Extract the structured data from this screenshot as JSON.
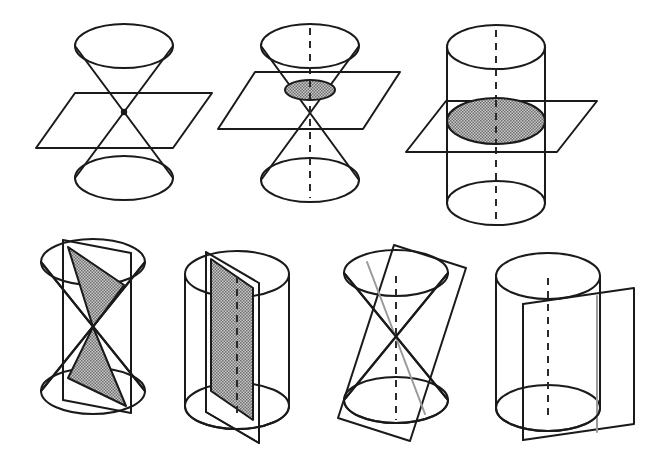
{
  "figure": {
    "title": "Conic sections and cylindrical sections",
    "background_color": "#ffffff",
    "line_color": "#1a1a1a",
    "hidden_line_color": "#2a2a2a",
    "shading_color": "#999999",
    "tangent_line_color": "#9a9a9a",
    "width": 646,
    "height": 469,
    "rows": 2,
    "panel_count": 7
  },
  "panels": [
    {
      "id": "panel-1",
      "row": 1,
      "column": 1,
      "solid": "double-cone",
      "plane": "horizontal-through-apex",
      "section": "point",
      "shaded": false,
      "axis_shown": false,
      "caption": "Plane through the apex of a double cone: the section is a single point"
    },
    {
      "id": "panel-2",
      "row": 1,
      "column": 2,
      "solid": "double-cone",
      "plane": "horizontal-above-apex",
      "section": "circle",
      "shaded": true,
      "axis_shown": true,
      "caption": "Horizontal plane cutting one nappe of a double cone: the section is a circle"
    },
    {
      "id": "panel-3",
      "row": 1,
      "column": 3,
      "solid": "cylinder",
      "plane": "horizontal",
      "section": "circle",
      "shaded": true,
      "axis_shown": true,
      "caption": "Horizontal plane cutting a cylinder: the section is a circle"
    },
    {
      "id": "panel-4",
      "row": 2,
      "column": 1,
      "solid": "double-cone",
      "plane": "vertical-through-axis",
      "section": "two-triangles",
      "shaded": true,
      "axis_shown": false,
      "caption": "Vertical plane through the axis of a double cone: the section is two triangles"
    },
    {
      "id": "panel-5",
      "row": 2,
      "column": 2,
      "solid": "cylinder",
      "plane": "vertical-through-axis",
      "section": "rectangle",
      "shaded": true,
      "axis_shown": true,
      "caption": "Vertical plane through the axis of a cylinder: the section is a rectangle"
    },
    {
      "id": "panel-6",
      "row": 2,
      "column": 3,
      "solid": "double-cone",
      "plane": "tangent-oblique",
      "section": "line",
      "shaded": false,
      "axis_shown": true,
      "caption": "Oblique tangent plane touching a double cone: the section is a single line"
    },
    {
      "id": "panel-7",
      "row": 2,
      "column": 4,
      "solid": "cylinder",
      "plane": "tangent-vertical",
      "section": "line",
      "shaded": false,
      "axis_shown": true,
      "caption": "Vertical tangent plane touching a cylinder: the section is a single line"
    }
  ],
  "geometry": {
    "panel_1": {
      "top_ellipse": {
        "cx": 124,
        "cy": 46,
        "rx": 49,
        "ry": 22
      },
      "bottom_ellipse": {
        "cx": 124,
        "cy": 178,
        "rx": 49,
        "ry": 22
      },
      "apex": {
        "x": 124,
        "y": 112
      },
      "plane_points": "75,93 212,93 173,148 36,148"
    },
    "panel_2": {
      "top_ellipse": {
        "cx": 310,
        "cy": 46,
        "rx": 49,
        "ry": 22
      },
      "bottom_ellipse": {
        "cx": 310,
        "cy": 180,
        "rx": 49,
        "ry": 22
      },
      "apex": {
        "x": 310,
        "y": 114
      },
      "section_ellipse": {
        "cx": 310,
        "cy": 90,
        "rx": 25,
        "ry": 10
      },
      "plane_points": "255,72 400,72 363,129 218,129"
    },
    "panel_3": {
      "top_ellipse": {
        "cx": 496,
        "cy": 47,
        "rx": 49,
        "ry": 22
      },
      "bottom_ellipse": {
        "cx": 496,
        "cy": 203,
        "rx": 49,
        "ry": 22
      },
      "section_ellipse": {
        "cx": 496,
        "cy": 121,
        "rx": 49,
        "ry": 23
      },
      "plane_points": "446,101 597,101 557,152 406,152"
    },
    "panel_4": {
      "top_ellipse": {
        "cx": 93,
        "cy": 262,
        "rx": 52,
        "ry": 23
      },
      "bottom_ellipse": {
        "cx": 93,
        "cy": 391,
        "rx": 52,
        "ry": 23
      },
      "apex": {
        "x": 93,
        "y": 327
      }
    },
    "panel_5": {
      "top_ellipse": {
        "cx": 237,
        "cy": 274,
        "rx": 52,
        "ry": 23
      },
      "bottom_ellipse": {
        "cx": 237,
        "cy": 406,
        "rx": 52,
        "ry": 23
      }
    },
    "panel_6": {
      "top_ellipse": {
        "cx": 396,
        "cy": 273,
        "rx": 52,
        "ry": 23
      },
      "bottom_ellipse": {
        "cx": 396,
        "cy": 400,
        "rx": 52,
        "ry": 23
      },
      "apex": {
        "x": 396,
        "y": 336
      },
      "plane_rotation_deg": -19
    },
    "panel_7": {
      "top_ellipse": {
        "cx": 548,
        "cy": 276,
        "rx": 52,
        "ry": 23
      },
      "bottom_ellipse": {
        "cx": 548,
        "cy": 408,
        "rx": 52,
        "ry": 23
      }
    }
  }
}
